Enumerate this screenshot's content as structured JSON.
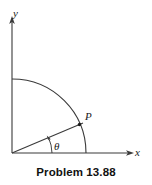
{
  "figure": {
    "caption": "Problem 13.88",
    "background_color": "#ffffff",
    "line_color": "#3a3a3a",
    "text_color": "#1a1a1a",
    "axes": {
      "y_label": "y",
      "x_label": "x",
      "origin": [
        12,
        153
      ],
      "y_axis_tip": [
        12,
        18
      ],
      "x_axis_tip": [
        132,
        153
      ]
    },
    "arc": {
      "description": "quarter-circle arc",
      "radius": 74,
      "start": [
        12,
        79
      ],
      "end": [
        86,
        153
      ]
    },
    "point": {
      "label": "P",
      "position": [
        80,
        124
      ]
    },
    "angle": {
      "label": "θ",
      "label_position": [
        54,
        148
      ],
      "degrees": 23
    },
    "radial_line": {
      "from": [
        12,
        153
      ],
      "to": [
        82,
        123
      ]
    }
  }
}
